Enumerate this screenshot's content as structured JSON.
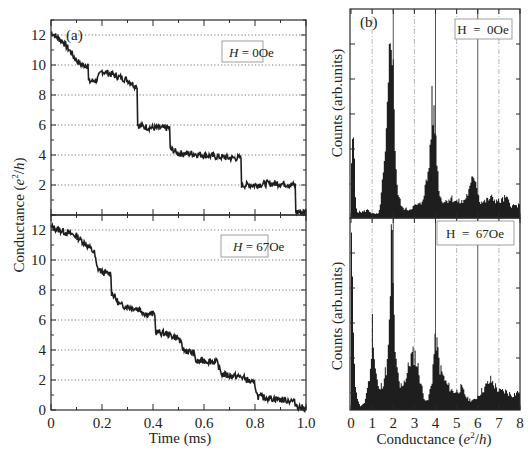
{
  "chart_data": [
    {
      "id": "a-top",
      "type": "line",
      "panel_label": "(a)",
      "legend": "H = 0Oe",
      "legend_H": "H",
      "legend_rest": " = 0Oe",
      "xlabel": "Time (ms)",
      "ylabel": "Conductance (e²/h)",
      "xlim": [
        0,
        1.0
      ],
      "ylim": [
        0,
        13
      ],
      "yticks": [
        2,
        4,
        6,
        8,
        10,
        12
      ],
      "grid": "horizontal dotted at even y",
      "x": [
        0,
        0.02,
        0.05,
        0.08,
        0.1,
        0.12,
        0.15,
        0.18,
        0.2,
        0.25,
        0.3,
        0.33,
        0.34,
        0.36,
        0.4,
        0.45,
        0.47,
        0.5,
        0.55,
        0.6,
        0.65,
        0.7,
        0.73,
        0.75,
        0.8,
        0.85,
        0.9,
        0.95,
        0.96,
        1.0
      ],
      "y": [
        12.2,
        11.9,
        11.5,
        10.8,
        10.3,
        10.0,
        8.9,
        9.0,
        9.6,
        9.3,
        9.0,
        8.6,
        6.0,
        5.9,
        5.8,
        5.8,
        4.4,
        4.1,
        4.1,
        4.0,
        3.9,
        3.8,
        3.8,
        2.0,
        2.0,
        2.1,
        2.1,
        2.0,
        0.2,
        0.2
      ]
    },
    {
      "id": "a-bottom",
      "type": "line",
      "legend": "H = 67Oe",
      "legend_H": "H",
      "legend_rest": " = 67Oe",
      "xlabel": "Time (ms)",
      "ylabel": "Conductance (e²/h)",
      "xlim": [
        0,
        1.0
      ],
      "ylim": [
        0,
        12.7
      ],
      "xticks": [
        0,
        0.2,
        0.4,
        0.6,
        0.8,
        1.0
      ],
      "xtick_labels": [
        "0",
        "0.2",
        "0.4",
        "0.6",
        "0.8",
        "1.0"
      ],
      "yticks": [
        0,
        2,
        4,
        6,
        8,
        10,
        12
      ],
      "grid": "horizontal dotted at even y",
      "x": [
        0,
        0.05,
        0.1,
        0.14,
        0.17,
        0.18,
        0.2,
        0.22,
        0.24,
        0.27,
        0.3,
        0.35,
        0.37,
        0.4,
        0.41,
        0.45,
        0.48,
        0.5,
        0.52,
        0.56,
        0.57,
        0.6,
        0.65,
        0.67,
        0.7,
        0.75,
        0.8,
        0.81,
        0.85,
        0.9,
        0.95,
        0.97,
        1.0
      ],
      "y": [
        12.2,
        11.9,
        11.6,
        11.0,
        10.5,
        9.5,
        9.2,
        9.1,
        7.8,
        7.0,
        6.9,
        6.7,
        6.4,
        6.4,
        5.2,
        5.1,
        4.9,
        4.8,
        4.0,
        3.8,
        3.2,
        3.3,
        3.2,
        2.4,
        2.3,
        2.2,
        1.7,
        0.9,
        0.8,
        0.7,
        0.6,
        0.2,
        0.1
      ]
    },
    {
      "id": "b-top",
      "type": "bar",
      "panel_label": "(b)",
      "legend": "H = 0Oe",
      "ylabel": "Counts (arb.units)",
      "xlim": [
        0,
        8
      ],
      "x": [
        0.0,
        0.1,
        0.2,
        0.3,
        0.5,
        0.8,
        1.0,
        1.3,
        1.5,
        1.6,
        1.7,
        1.8,
        1.9,
        2.0,
        2.1,
        2.2,
        2.4,
        2.7,
        3.0,
        3.3,
        3.6,
        3.7,
        3.8,
        3.9,
        4.0,
        4.1,
        4.2,
        4.4,
        4.7,
        5.0,
        5.3,
        5.6,
        5.8,
        5.9,
        6.0,
        6.1,
        6.3,
        6.6,
        7.0,
        7.3,
        7.6,
        8.0
      ],
      "values": [
        28,
        40,
        6,
        3,
        3,
        4,
        2,
        2,
        20,
        30,
        50,
        80,
        100,
        60,
        28,
        12,
        5,
        4,
        6,
        7,
        20,
        30,
        55,
        50,
        40,
        20,
        10,
        8,
        10,
        8,
        8,
        14,
        22,
        18,
        12,
        8,
        8,
        10,
        8,
        10,
        6,
        6
      ],
      "vertical_grid": "solid at 2,4,6; dash-dot at 1,3,5,7"
    },
    {
      "id": "b-bottom",
      "type": "bar",
      "legend": "H = 67Oe",
      "xlabel": "Conductance (e²/h)",
      "ylabel": "Counts (arb.units)",
      "xlim": [
        0,
        8
      ],
      "xticks": [
        0,
        1,
        2,
        3,
        4,
        5,
        6,
        7,
        8
      ],
      "x": [
        0.0,
        0.05,
        0.2,
        0.4,
        0.6,
        0.8,
        0.9,
        1.0,
        1.1,
        1.3,
        1.5,
        1.7,
        1.8,
        1.9,
        2.0,
        2.1,
        2.3,
        2.6,
        2.8,
        3.0,
        3.2,
        3.4,
        3.6,
        3.8,
        3.9,
        4.0,
        4.2,
        4.5,
        4.8,
        5.0,
        5.2,
        5.5,
        5.8,
        6.0,
        6.3,
        6.6,
        7.0,
        7.3,
        7.6,
        8.0
      ],
      "values": [
        90,
        60,
        10,
        2,
        3,
        15,
        20,
        50,
        25,
        10,
        15,
        25,
        45,
        100,
        55,
        25,
        12,
        18,
        28,
        30,
        20,
        8,
        4,
        15,
        30,
        38,
        22,
        14,
        10,
        10,
        12,
        6,
        5,
        8,
        12,
        16,
        10,
        10,
        8,
        10
      ],
      "vertical_grid": "solid at 2,4,6; dash-dot at 1,3,5,7"
    }
  ],
  "labels": {
    "panel_a": "(a)",
    "panel_b": "(b)",
    "left_ylabel_main": "Conductance (",
    "left_ylabel_e": "e",
    "left_ylabel_sup": "2",
    "left_ylabel_slash": "/",
    "left_ylabel_h": "h",
    "left_ylabel_close": ")",
    "left_xlabel": "Time (ms)",
    "right_ylabel": "Counts (arb.units)",
    "right_xlabel_main": "Conductance (",
    "right_xlabel_e": "e",
    "right_xlabel_sup": "2",
    "right_xlabel_slash": "/",
    "right_xlabel_h": "h",
    "right_xlabel_close": ")",
    "legend_a_top_H": "H",
    "legend_a_top_rest": " = 0Oe",
    "legend_a_bot_H": "H",
    "legend_a_bot_rest": " = 67Oe",
    "legend_b_top": "H  =  0Oe",
    "legend_b_bot": "H  =  67Oe",
    "left_top_yticks": [
      "12",
      "10",
      "8",
      "6",
      "4",
      "2"
    ],
    "left_bot_yticks": [
      "12",
      "10",
      "8",
      "6",
      "4",
      "2",
      "0"
    ],
    "left_xticks": [
      "0",
      "0.2",
      "0.4",
      "0.6",
      "0.8",
      "1.0"
    ],
    "right_xticks": [
      "0",
      "1",
      "2",
      "3",
      "4",
      "5",
      "6",
      "7",
      "8"
    ]
  },
  "colors": {
    "trace": "#1e1e1e",
    "axis": "#2a2a2a",
    "grid": "#555555",
    "background": "#ffffff"
  }
}
